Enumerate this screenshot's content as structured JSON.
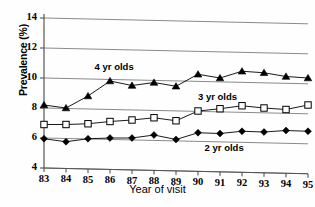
{
  "chart_data": {
    "type": "line",
    "title": "",
    "xlabel": "Year of visit",
    "ylabel": "Prevalence (%)",
    "categories": [
      "83",
      "84",
      "85",
      "86",
      "87",
      "88",
      "89",
      "90",
      "91",
      "92",
      "93",
      "94",
      "95"
    ],
    "x": [
      83,
      84,
      85,
      86,
      87,
      88,
      89,
      90,
      91,
      92,
      93,
      94,
      95
    ],
    "xlim": [
      83,
      95
    ],
    "ylim": [
      4,
      14
    ],
    "yticks": [
      4,
      6,
      8,
      10,
      12,
      14
    ],
    "grid": true,
    "legend": "inline-annotations",
    "series": [
      {
        "name": "4 yr olds",
        "marker": "filled-triangle",
        "color": "#000000",
        "values": [
          8.2,
          8.0,
          8.8,
          9.8,
          9.5,
          9.7,
          9.45,
          10.25,
          10.0,
          10.45,
          10.35,
          10.1,
          10.0
        ]
      },
      {
        "name": "3 yr olds",
        "marker": "open-square",
        "color": "#000000",
        "values": [
          6.9,
          6.9,
          6.95,
          7.1,
          7.2,
          7.35,
          7.15,
          7.8,
          7.95,
          8.15,
          8.0,
          7.9,
          8.2
        ]
      },
      {
        "name": "2 yr olds",
        "marker": "filled-diamond",
        "color": "#000000",
        "values": [
          5.95,
          5.75,
          5.95,
          6.0,
          6.0,
          6.2,
          5.9,
          6.35,
          6.3,
          6.45,
          6.4,
          6.5,
          6.45
        ]
      }
    ],
    "annotations": [
      {
        "text": "4 yr olds",
        "x": 86.3,
        "y": 10.75
      },
      {
        "text": "3 yr olds",
        "x": 91.0,
        "y": 8.75
      },
      {
        "text": "2 yr olds",
        "x": 91.3,
        "y": 5.35
      }
    ]
  }
}
